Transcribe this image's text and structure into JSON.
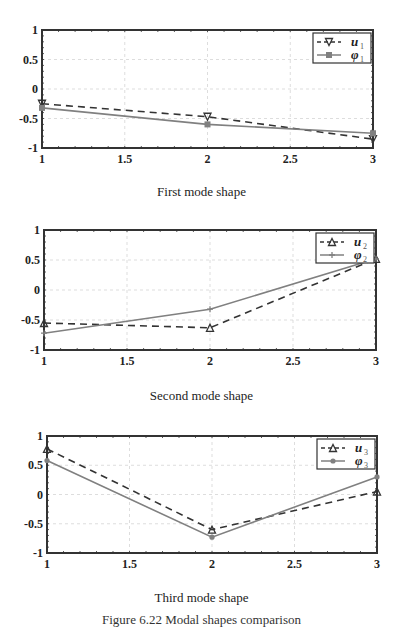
{
  "figure_caption": "Figure 6.22 Modal shapes comparison",
  "chart_data": [
    {
      "type": "line",
      "title": "First mode shape",
      "x": [
        1,
        2,
        3
      ],
      "xticks": [
        "1",
        "1.5",
        "2",
        "2.5",
        "3"
      ],
      "yticks": [
        "1",
        "0.5",
        "0",
        "-0.5",
        "-1"
      ],
      "xlim": [
        1,
        3
      ],
      "ylim": [
        -1,
        1
      ],
      "grid": true,
      "legend_position": "upper right",
      "series": [
        {
          "name": "u1",
          "label": "u",
          "sub": "1",
          "style": "dashed",
          "marker": "triangle-down",
          "color": "#333333",
          "values": [
            -0.25,
            -0.47,
            -0.85
          ]
        },
        {
          "name": "phi1",
          "label": "φ",
          "sub": "1",
          "style": "solid",
          "marker": "square",
          "color": "#808080",
          "values": [
            -0.32,
            -0.6,
            -0.75
          ]
        }
      ]
    },
    {
      "type": "line",
      "title": "Second mode shape",
      "x": [
        1,
        2,
        3
      ],
      "xticks": [
        "1",
        "1.5",
        "2",
        "2.5",
        "3"
      ],
      "yticks": [
        "1",
        "0.5",
        "0",
        "-0.5",
        "-1"
      ],
      "xlim": [
        1,
        3
      ],
      "ylim": [
        -1,
        1
      ],
      "grid": true,
      "legend_position": "upper right",
      "series": [
        {
          "name": "u2",
          "label": "u",
          "sub": "2",
          "style": "dashed",
          "marker": "triangle-up",
          "color": "#333333",
          "values": [
            -0.55,
            -0.63,
            0.52
          ]
        },
        {
          "name": "phi2",
          "label": "φ",
          "sub": "2",
          "style": "solid",
          "marker": "plus",
          "color": "#808080",
          "values": [
            -0.72,
            -0.32,
            0.52
          ]
        }
      ]
    },
    {
      "type": "line",
      "title": "Third mode shape",
      "x": [
        1,
        2,
        3
      ],
      "xticks": [
        "1",
        "1.5",
        "2",
        "2.5",
        "3"
      ],
      "yticks": [
        "1",
        "0.5",
        "0",
        "-0.5",
        "-1"
      ],
      "xlim": [
        1,
        3
      ],
      "ylim": [
        -1,
        1
      ],
      "grid": true,
      "legend_position": "upper right",
      "series": [
        {
          "name": "u3",
          "label": "u",
          "sub": "3",
          "style": "dashed",
          "marker": "triangle-up",
          "color": "#333333",
          "values": [
            0.78,
            -0.6,
            0.05
          ]
        },
        {
          "name": "phi3",
          "label": "φ",
          "sub": "3",
          "style": "solid",
          "marker": "circle",
          "color": "#808080",
          "values": [
            0.58,
            -0.73,
            0.3
          ]
        }
      ]
    }
  ],
  "layout": {
    "plots": [
      {
        "left": 42,
        "right": 373,
        "top": 30,
        "bottom": 148,
        "caption_top": 184
      },
      {
        "left": 44,
        "right": 376,
        "top": 230,
        "bottom": 350,
        "caption_top": 388
      },
      {
        "left": 47,
        "right": 377,
        "top": 436,
        "bottom": 553,
        "caption_top": 590
      }
    ]
  }
}
